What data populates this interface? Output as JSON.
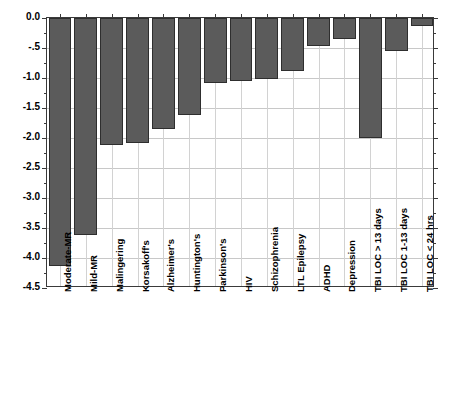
{
  "chart_data": {
    "type": "bar",
    "title": "",
    "subtitle": "",
    "xlabel": "",
    "ylabel": "",
    "orientation": "vertical",
    "grid": true,
    "legend": null,
    "ylim": [
      -4.5,
      0.0
    ],
    "ytick_labels": [
      "0.0",
      "-.5",
      "-1.0",
      "-1.5",
      "-2.0",
      "-2.5",
      "-3.0",
      "-3.5",
      "-4.0",
      "-4.5"
    ],
    "ytick_values": [
      0.0,
      -0.5,
      -1.0,
      -1.5,
      -2.0,
      -2.5,
      -3.0,
      -3.5,
      -4.0,
      -4.5
    ],
    "categories": [
      "Moderate-MR",
      "Mild-MR",
      "Malingering",
      "Korsakoff's",
      "Alzheimer's",
      "Huntington's",
      "Parkinson's",
      "HIV",
      "Schizophrenia",
      "LTL Epilepsy",
      "ADHD",
      "Depression",
      "TBI LOC > 13 days",
      "TBI LOC 1-13 days",
      "TBI LOC < 24 hrs"
    ],
    "values": [
      -4.13,
      -3.62,
      -2.12,
      -2.08,
      -1.85,
      -1.62,
      -1.08,
      -1.05,
      -1.02,
      -0.88,
      -0.47,
      -0.35,
      -2.0,
      -0.55,
      -0.13
    ],
    "bar_color": "#5b5b5b",
    "bar_edge_color": "#2e2e2e",
    "grid_color": "#c8c8c8",
    "axis_color": "#3a3a3a",
    "background": "#ffffff"
  }
}
